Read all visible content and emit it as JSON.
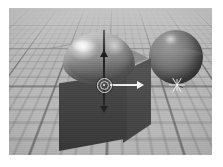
{
  "app": {
    "kind": "3d-viewport-render",
    "title": "3D Viewport",
    "view_label": "Perspective",
    "shading_label": "Smooth Shaded",
    "render_style": "grayscale"
  },
  "viewport": {
    "width_px": 203,
    "height_px": 147,
    "background_color": "#b9b9b9",
    "sky_color": "#c2c2c2",
    "grid": {
      "visible": true,
      "major_line_color": "#5a5a5a",
      "minor_line_color": "#787878",
      "major_spacing_px": 27,
      "minor_divisions": 5,
      "plane": "XZ",
      "label": "Ground Grid"
    }
  },
  "objects": [
    {
      "id": "cube",
      "name": "Cube",
      "type": "box",
      "selected": true,
      "top_face_color": "#919191",
      "front_face_color": "#3f3f3f",
      "right_face_color": "#474747"
    },
    {
      "id": "dome",
      "name": "Sphere (embedded)",
      "type": "sphere",
      "selected": false,
      "base_color": "#8e8e8e",
      "highlight_color": "#f5f5f5",
      "shadow_color": "#5e5e5e"
    },
    {
      "id": "sphere",
      "name": "Sphere",
      "type": "sphere",
      "selected": false,
      "base_color": "#606060",
      "highlight_color": "#e1e1e1",
      "shadow_color": "#3b3b3b"
    }
  ],
  "manipulator": {
    "label": "Transform Manipulator",
    "mode": "move",
    "axes": [
      {
        "id": "x",
        "label": "X Axis",
        "direction": "right",
        "color": "#fafafa"
      },
      {
        "id": "y",
        "label": "Y Axis",
        "direction": "up",
        "color": "#1c1c1c"
      },
      {
        "id": "z",
        "label": "Z Axis",
        "direction": "down",
        "color": "#232323"
      }
    ],
    "center_handle_label": "Center Screen Handle"
  },
  "pivot_marker": {
    "label": "Pivot Marker",
    "color": "#f8f8f8"
  }
}
